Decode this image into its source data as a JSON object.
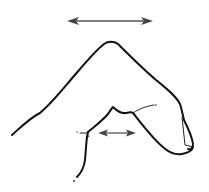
{
  "illustration": {
    "subject": "hand-finger-line-drawing",
    "background": "#ffffff",
    "stroke_color": "#111111",
    "arrow_color": "#444444",
    "arrows": [
      {
        "name": "top-stretch-arrow",
        "type": "double-headed",
        "x1": 68,
        "x2": 152,
        "y": 21
      },
      {
        "name": "knuckle-stretch-arrow",
        "type": "double-headed",
        "x1": 98,
        "x2": 135,
        "y": 133
      }
    ]
  }
}
